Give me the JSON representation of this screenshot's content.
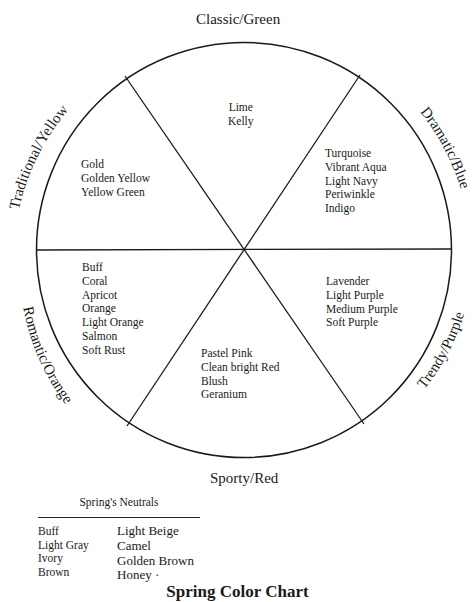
{
  "wheel": {
    "labels": {
      "top": "Classic/Green",
      "bottom": "Sporty/Red",
      "upper_left": "Traditional/Yellow",
      "upper_right": "Dramatic/Blue",
      "lower_left": "Romantic/Orange",
      "lower_right": "Trendy/Purple"
    },
    "segments": {
      "green": [
        "Lime",
        "Kelly"
      ],
      "yellow": [
        "Gold",
        "Golden Yellow",
        "Yellow Green"
      ],
      "blue": [
        "Turquoise",
        "Vibrant Aqua",
        "Light Navy",
        "Periwinkle",
        "Indigo"
      ],
      "orange": [
        "Buff",
        "Coral",
        "Apricot",
        "Orange",
        "Light Orange",
        "Salmon",
        "Soft Rust"
      ],
      "purple": [
        "Lavender",
        "Light Purple",
        "Medium Purple",
        "Soft Purple"
      ],
      "red": [
        "Pastel Pink",
        "Clean bright Red",
        "Blush",
        "Geranium"
      ]
    }
  },
  "neutrals": {
    "title": "Spring's Neutrals",
    "col1": [
      "Buff",
      "Light Gray",
      "Ivory",
      "Brown"
    ],
    "col2": [
      "Light Beige",
      "Camel",
      "Golden Brown",
      "Honey ·"
    ]
  },
  "chart_title": "Spring Color Chart",
  "colors": {
    "ink": "#1a1a1a",
    "background": "#ffffff"
  }
}
